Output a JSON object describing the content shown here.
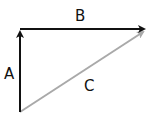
{
  "diagram": {
    "title": "",
    "type": "vector triangle",
    "colors": {
      "dark_vector": "#111111",
      "result_vector": "#a9a9a9",
      "background": "#ffffff"
    },
    "vectors": [
      {
        "id": "A",
        "label": "A",
        "from": [
          20,
          112
        ],
        "to": [
          20,
          28
        ],
        "color": "#111111"
      },
      {
        "id": "B",
        "label": "B",
        "from": [
          20,
          29
        ],
        "to": [
          148,
          29
        ],
        "color": "#111111"
      },
      {
        "id": "C",
        "label": "C",
        "from": [
          20,
          112
        ],
        "to": [
          146,
          31
        ],
        "color": "#a9a9a9"
      }
    ],
    "labels": {
      "a": "A",
      "b": "B",
      "c": "C"
    }
  }
}
